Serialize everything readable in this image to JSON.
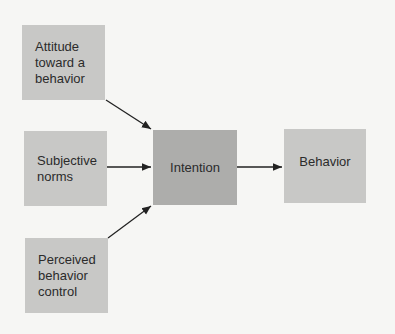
{
  "diagram": {
    "nodes": [
      {
        "id": "attitude",
        "label": "Attitude\ntoward a\nbehavior"
      },
      {
        "id": "norms",
        "label": "Subjective\nnorms"
      },
      {
        "id": "control",
        "label": "Perceived\nbehavior\ncontrol"
      },
      {
        "id": "intention",
        "label": "Intention"
      },
      {
        "id": "behavior",
        "label": "Behavior"
      }
    ],
    "edges": [
      {
        "from": "attitude",
        "to": "intention"
      },
      {
        "from": "norms",
        "to": "intention"
      },
      {
        "from": "control",
        "to": "intention"
      },
      {
        "from": "intention",
        "to": "behavior"
      }
    ],
    "colors": {
      "background": "#f6f6f4",
      "box": "#c8c8c6",
      "intention_box": "#adadab",
      "arrow": "#222222"
    }
  }
}
